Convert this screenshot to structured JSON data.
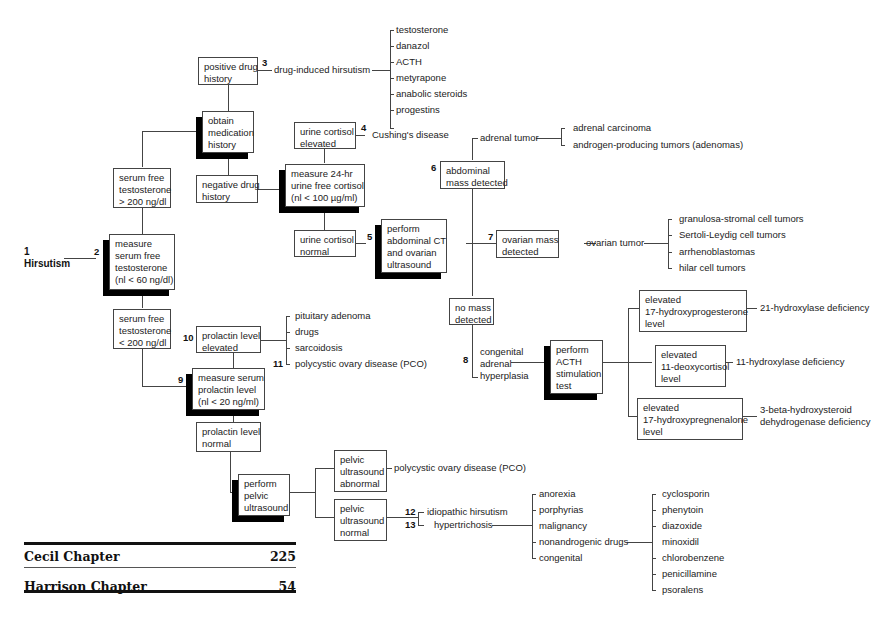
{
  "start": {
    "number": "1",
    "label": "Hirsutism"
  },
  "boxes": {
    "measure_testosterone": {
      "number": "2",
      "lines": [
        "measure",
        "serum free",
        "testosterone",
        "(nl < 60 ng/dl)"
      ]
    },
    "high_testosterone": {
      "lines": [
        "serum free",
        "testosterone",
        "> 200 ng/dl"
      ]
    },
    "low_testosterone": {
      "lines": [
        "serum free",
        "testosterone",
        "< 200 ng/dl"
      ]
    },
    "obtain_medication": {
      "lines": [
        "obtain",
        "medication",
        "history"
      ]
    },
    "positive_drug": {
      "lines": [
        "positive drug",
        "history"
      ]
    },
    "negative_drug": {
      "lines": [
        "negative drug",
        "history"
      ]
    },
    "measure_cortisol": {
      "lines": [
        "measure 24-hr",
        "urine free cortisol",
        "(nl < 100 µg/ml)"
      ]
    },
    "cortisol_elevated": {
      "lines": [
        "urine cortisol",
        "elevated"
      ]
    },
    "cortisol_normal": {
      "lines": [
        "urine cortisol",
        "normal"
      ]
    },
    "perform_ct": {
      "number": "5",
      "lines": [
        "perform",
        "abdominal CT",
        "and ovarian",
        "ultrasound"
      ]
    },
    "abdominal_mass": {
      "number": "6",
      "lines": [
        "abdominal",
        "mass detected"
      ]
    },
    "ovarian_mass": {
      "number": "7",
      "lines": [
        "ovarian mass",
        "detected"
      ]
    },
    "no_mass": {
      "lines": [
        "no mass",
        "detected"
      ]
    },
    "acth_test": {
      "lines": [
        "perform",
        "ACTH",
        "stimulation",
        "test"
      ]
    },
    "elev_17ohp": {
      "lines": [
        "elevated",
        "17-hydroxyprogesterone",
        "level"
      ]
    },
    "elev_11doc": {
      "lines": [
        "elevated",
        "11-deoxycortisol",
        "level"
      ]
    },
    "elev_17ohpreg": {
      "lines": [
        "elevated",
        "17-hydroxypregnenalone",
        "level"
      ]
    },
    "measure_prolactin": {
      "number": "9",
      "lines": [
        "measure serum",
        "prolactin level",
        "(nl < 20 ng/ml)"
      ]
    },
    "prolactin_elevated": {
      "number": "10",
      "lines": [
        "prolactin level",
        "elevated"
      ]
    },
    "prolactin_normal": {
      "lines": [
        "prolactin level",
        "normal"
      ]
    },
    "pelvic_us": {
      "lines": [
        "perform",
        "pelvic",
        "ultrasound"
      ]
    },
    "pelvic_abnormal": {
      "lines": [
        "pelvic",
        "ultrasound",
        "abnormal"
      ]
    },
    "pelvic_normal": {
      "lines": [
        "pelvic",
        "ultrasound",
        "normal"
      ]
    }
  },
  "labels": {
    "drug_induced": {
      "number": "3",
      "text": "drug-induced hirsutism"
    },
    "drugs": [
      "testosterone",
      "danazol",
      "ACTH",
      "metyrapone",
      "anabolic steroids",
      "progestins"
    ],
    "cushings": {
      "number": "4",
      "text": "Cushing's disease"
    },
    "adrenal_tumor": "adrenal tumor",
    "adrenal_types": [
      "adrenal carcinoma",
      "androgen-producing tumors (adenomas)"
    ],
    "ovarian_tumor": "ovarian tumor",
    "ovarian_types": [
      "granulosa-stromal cell tumors",
      "Sertoli-Leydig cell tumors",
      "arrhenoblastomas",
      "hilar cell tumors"
    ],
    "cah": {
      "number": "8",
      "lines": [
        "congenital",
        "adrenal",
        "hyperplasia"
      ]
    },
    "def_21": "21-hydroxylase deficiency",
    "def_11": "11-hydroxylase deficiency",
    "def_3b": [
      "3-beta-hydroxysteroid",
      "dehydrogenase deficiency"
    ],
    "prolactin_causes": [
      "pituitary adenoma",
      "drugs",
      "sarcoidosis",
      "polycystic ovary disease (PCO)"
    ],
    "prolactin_pco_number": "11",
    "pco": "polycystic ovary disease (PCO)",
    "idiopathic": {
      "number": "12",
      "text": "idiopathic hirsutism"
    },
    "hypertrichosis": {
      "number": "13",
      "text": "hypertrichosis"
    },
    "hypertrichosis_causes": [
      "anorexia",
      "porphyrias",
      "malignancy",
      "nonandrogenic drugs",
      "congenital"
    ],
    "nonandrogenic_drugs": [
      "cyclosporin",
      "phenytoin",
      "diazoxide",
      "minoxidil",
      "chlorobenzene",
      "penicillamine",
      "psoralens"
    ]
  },
  "references": [
    {
      "label": "Cecil Chapter",
      "value": "225"
    },
    {
      "label": "Harrison Chapter",
      "value": "54"
    }
  ]
}
